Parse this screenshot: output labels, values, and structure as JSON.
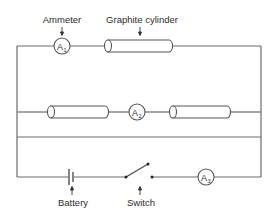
{
  "diagram": {
    "labels": {
      "ammeter": "Ammeter",
      "graphite_cylinder": "Graphite cylinder",
      "battery": "Battery",
      "switch": "Switch"
    },
    "meters": [
      {
        "id": "A1",
        "letter": "A",
        "sub": "1"
      },
      {
        "id": "A2",
        "letter": "A",
        "sub": "2"
      },
      {
        "id": "A3",
        "letter": "A",
        "sub": "3"
      }
    ],
    "colors": {
      "wire": "#6a6a6a",
      "component": "#555555",
      "text": "#2b2b2b",
      "background": "#ffffff"
    }
  }
}
